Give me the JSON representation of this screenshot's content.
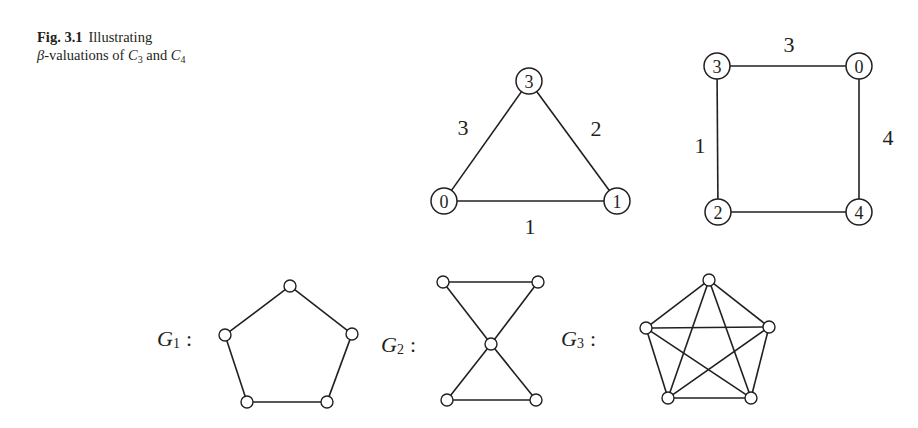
{
  "caption": {
    "fig_label": "Fig. 3.1",
    "line1": "Illustrating",
    "beta": "β",
    "line2_a": "-valuations of ",
    "c3_base": "C",
    "c3_sub": "3",
    "and": " and ",
    "c4_base": "C",
    "c4_sub": "4"
  },
  "graphs": {
    "c3": {
      "name": "C3 beta-valuation",
      "node_radius": 13,
      "nodes": [
        {
          "id": "top",
          "label": "3",
          "x": 529,
          "y": 81
        },
        {
          "id": "left",
          "label": "0",
          "x": 444,
          "y": 201
        },
        {
          "id": "right",
          "label": "1",
          "x": 617,
          "y": 201
        }
      ],
      "edges": [
        {
          "from": "left",
          "to": "top",
          "label": "3",
          "lx": 463,
          "ly": 127
        },
        {
          "from": "top",
          "to": "right",
          "label": "2",
          "lx": 596,
          "ly": 128
        },
        {
          "from": "left",
          "to": "right",
          "label": "1",
          "lx": 530,
          "ly": 226
        }
      ]
    },
    "c4": {
      "name": "C4 beta-valuation",
      "node_radius": 13,
      "nodes": [
        {
          "id": "tl",
          "label": "3",
          "x": 717,
          "y": 66
        },
        {
          "id": "tr",
          "label": "0",
          "x": 859,
          "y": 66
        },
        {
          "id": "bl",
          "label": "2",
          "x": 718,
          "y": 212
        },
        {
          "id": "br",
          "label": "4",
          "x": 859,
          "y": 212
        }
      ],
      "edges": [
        {
          "from": "tl",
          "to": "tr",
          "label": "3",
          "lx": 789,
          "ly": 44
        },
        {
          "from": "tl",
          "to": "bl",
          "label": "1",
          "lx": 700,
          "ly": 145
        },
        {
          "from": "tr",
          "to": "br",
          "label": "4",
          "lx": 888,
          "ly": 137
        },
        {
          "from": "bl",
          "to": "br",
          "label": "",
          "lx": 0,
          "ly": 0
        }
      ]
    },
    "g1": {
      "label_base": "G",
      "label_sub": "1",
      "label_colon": ":",
      "label_x": 157,
      "label_y": 338,
      "node_radius": 6,
      "nodes": [
        {
          "id": "a",
          "x": 290,
          "y": 286
        },
        {
          "id": "b",
          "x": 352,
          "y": 334
        },
        {
          "id": "c",
          "x": 327,
          "y": 402
        },
        {
          "id": "d",
          "x": 247,
          "y": 402
        },
        {
          "id": "e",
          "x": 225,
          "y": 335
        }
      ],
      "edges": [
        [
          "a",
          "b"
        ],
        [
          "b",
          "c"
        ],
        [
          "c",
          "d"
        ],
        [
          "d",
          "e"
        ],
        [
          "e",
          "a"
        ]
      ]
    },
    "g2": {
      "label_base": "G",
      "label_sub": "2",
      "label_colon": ":",
      "label_x": 381,
      "label_y": 344,
      "node_radius": 6,
      "nodes": [
        {
          "id": "tl",
          "x": 443,
          "y": 282
        },
        {
          "id": "tr",
          "x": 538,
          "y": 282
        },
        {
          "id": "c",
          "x": 491,
          "y": 344
        },
        {
          "id": "bl",
          "x": 447,
          "y": 400
        },
        {
          "id": "br",
          "x": 536,
          "y": 400
        }
      ],
      "edges": [
        [
          "tl",
          "tr"
        ],
        [
          "tl",
          "c"
        ],
        [
          "tr",
          "c"
        ],
        [
          "c",
          "bl"
        ],
        [
          "c",
          "br"
        ],
        [
          "bl",
          "br"
        ]
      ]
    },
    "g3": {
      "label_base": "G",
      "label_sub": "3",
      "label_colon": ":",
      "label_x": 561,
      "label_y": 338,
      "node_radius": 6,
      "nodes": [
        {
          "id": "a",
          "x": 709,
          "y": 280
        },
        {
          "id": "b",
          "x": 769,
          "y": 327
        },
        {
          "id": "c",
          "x": 751,
          "y": 398
        },
        {
          "id": "d",
          "x": 668,
          "y": 398
        },
        {
          "id": "e",
          "x": 646,
          "y": 328
        }
      ],
      "edges": [
        [
          "a",
          "b"
        ],
        [
          "a",
          "c"
        ],
        [
          "a",
          "d"
        ],
        [
          "a",
          "e"
        ],
        [
          "b",
          "c"
        ],
        [
          "b",
          "d"
        ],
        [
          "b",
          "e"
        ],
        [
          "c",
          "d"
        ],
        [
          "c",
          "e"
        ],
        [
          "d",
          "e"
        ]
      ]
    }
  },
  "colors": {
    "ink": "#231f20",
    "background": "#ffffff"
  }
}
